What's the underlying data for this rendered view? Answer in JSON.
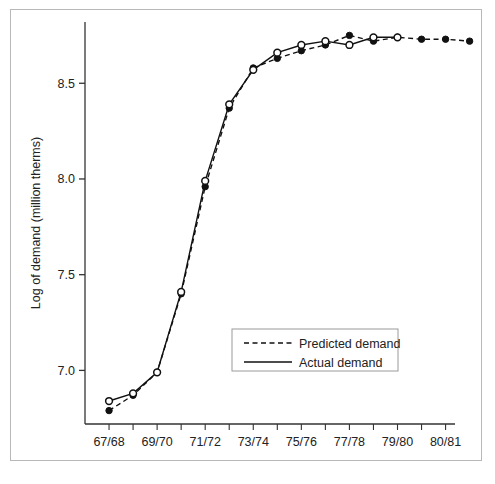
{
  "chart_data": {
    "type": "line",
    "title": "",
    "xlabel": "",
    "ylabel": "Log of demand (million therms)",
    "x_tick_labels": [
      "67/68",
      "69/70",
      "71/72",
      "73/74",
      "75/76",
      "77/78",
      "79/80",
      "80/81"
    ],
    "x_tick_values": [
      1,
      3,
      5,
      7,
      9,
      11,
      13,
      15
    ],
    "y_tick_labels": [
      "7.0",
      "7.5",
      "8.0",
      "8.5"
    ],
    "y_tick_values": [
      7.0,
      7.5,
      8.0,
      8.5
    ],
    "ylim": [
      6.72,
      8.82
    ],
    "xlim": [
      0,
      15.6
    ],
    "grid": false,
    "legend_position": "lower-right-inside",
    "series": [
      {
        "name": "Actual demand",
        "style": "solid",
        "marker": "open-circle",
        "x": [
          1,
          2,
          3,
          4,
          5,
          6,
          7,
          8,
          9,
          10,
          11,
          12,
          13
        ],
        "values": [
          6.84,
          6.88,
          6.99,
          7.41,
          7.99,
          8.39,
          8.57,
          8.66,
          8.7,
          8.72,
          8.7,
          8.74,
          8.74
        ]
      },
      {
        "name": "Predicted demand",
        "style": "dashed",
        "marker": "filled-circle",
        "x": [
          1,
          2,
          3,
          4,
          5,
          6,
          7,
          8,
          9,
          10,
          11,
          12,
          13,
          14,
          15,
          16
        ],
        "values": [
          6.79,
          6.87,
          6.99,
          7.4,
          7.96,
          8.37,
          8.58,
          8.63,
          8.67,
          8.7,
          8.75,
          8.72,
          8.74,
          8.73,
          8.73,
          8.72
        ]
      }
    ],
    "legend": [
      {
        "label": "Predicted demand",
        "style": "dashed",
        "marker": "none"
      },
      {
        "label": "Actual demand",
        "style": "solid",
        "marker": "none"
      }
    ],
    "colors": {
      "line": "#111111",
      "axis": "#333333",
      "text": "#222222",
      "frame": "#b8b8b8",
      "background": "#ffffff"
    }
  },
  "caption": {
    "text": ""
  }
}
